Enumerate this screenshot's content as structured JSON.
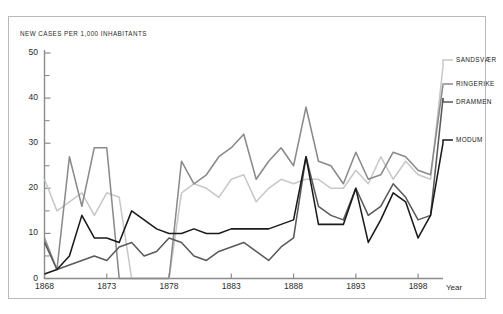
{
  "figure": {
    "y_axis_title": "NEW CASES PER 1,000 INHABITANTS",
    "x_axis_title": "Year"
  },
  "axes": {
    "y_ticks": [
      "0",
      "10",
      "20",
      "30",
      "40",
      "50"
    ],
    "x_ticks": [
      "1868",
      "1873",
      "1878",
      "1883",
      "1888",
      "1893",
      "1898"
    ]
  },
  "legend": {
    "items": [
      {
        "label": "SANDSVÆR",
        "color": "#c8c8c8"
      },
      {
        "label": "RINGERIKE",
        "color": "#8a8a8a"
      },
      {
        "label": "DRAMMEN",
        "color": "#5a5a5a"
      },
      {
        "label": "MODUM",
        "color": "#1a1a1a"
      }
    ]
  },
  "chart_data": {
    "type": "line",
    "title": "",
    "xlabel": "Year",
    "ylabel": "NEW CASES PER 1,000 INHABITANTS",
    "xlim": [
      1868,
      1900
    ],
    "ylim": [
      0,
      50
    ],
    "grid": false,
    "legend_position": "right-inline",
    "x": [
      1868,
      1869,
      1870,
      1871,
      1872,
      1873,
      1874,
      1875,
      1876,
      1877,
      1878,
      1879,
      1880,
      1881,
      1882,
      1883,
      1884,
      1885,
      1886,
      1887,
      1888,
      1889,
      1890,
      1891,
      1892,
      1893,
      1894,
      1895,
      1896,
      1897,
      1898,
      1899,
      1900
    ],
    "series": [
      {
        "name": "SANDSVÆR",
        "color": "#c8c8c8",
        "values": [
          22,
          15,
          17,
          19,
          14,
          19,
          18,
          0,
          0,
          0,
          0,
          19,
          21,
          20,
          18,
          22,
          23,
          17,
          20,
          22,
          21,
          22,
          22,
          20,
          20,
          24,
          21,
          27,
          22,
          26,
          23,
          22,
          47
        ]
      },
      {
        "name": "RINGERIKE",
        "color": "#8a8a8a",
        "values": [
          9,
          2,
          27,
          16,
          29,
          29,
          0,
          0,
          0,
          0,
          0,
          26,
          21,
          23,
          27,
          29,
          32,
          22,
          26,
          29,
          25,
          38,
          26,
          25,
          21,
          28,
          22,
          23,
          28,
          27,
          24,
          23,
          43
        ]
      },
      {
        "name": "DRAMMEN",
        "color": "#5a5a5a",
        "values": [
          8,
          2,
          3,
          4,
          5,
          4,
          7,
          8,
          5,
          6,
          9,
          8,
          5,
          4,
          6,
          7,
          8,
          6,
          4,
          7,
          9,
          27,
          16,
          14,
          13,
          20,
          14,
          16,
          21,
          18,
          13,
          14,
          40
        ]
      },
      {
        "name": "MODUM",
        "color": "#1a1a1a",
        "values": [
          1,
          2,
          5,
          14,
          9,
          9,
          8,
          15,
          13,
          11,
          10,
          10,
          11,
          10,
          10,
          11,
          11,
          11,
          11,
          12,
          13,
          27,
          12,
          12,
          12,
          20,
          8,
          13,
          19,
          17,
          9,
          14,
          30
        ]
      }
    ]
  }
}
